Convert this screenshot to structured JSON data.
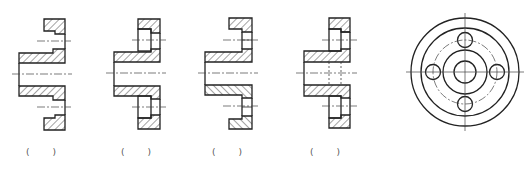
{
  "diagram": {
    "title": "",
    "views": [
      {
        "id": "view-1",
        "type": "section",
        "label": "(  )"
      },
      {
        "id": "view-2",
        "type": "section",
        "label": "(  )"
      },
      {
        "id": "view-3",
        "type": "section",
        "label": "(  )"
      },
      {
        "id": "view-4",
        "type": "section",
        "label": "(  )"
      },
      {
        "id": "view-5",
        "type": "end-view",
        "label": ""
      }
    ],
    "colors": {
      "line": "#222222",
      "hatch": "#333333",
      "center": "#444444"
    }
  }
}
